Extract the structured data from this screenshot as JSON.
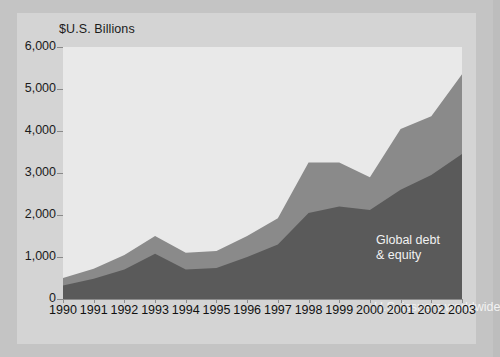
{
  "chart_data": {
    "type": "area",
    "title": "",
    "ylabel": "$U.S. Billions",
    "xlabel": "",
    "ylim": [
      0,
      6000
    ],
    "yticks": [
      0,
      1000,
      2000,
      3000,
      4000,
      5000,
      6000
    ],
    "ytick_labels": [
      "0",
      "1,000",
      "2,000",
      "3,000",
      "4,000",
      "5,000",
      "6,000"
    ],
    "categories": [
      "1990",
      "1991",
      "1992",
      "1993",
      "1994",
      "1995",
      "1996",
      "1997",
      "1998",
      "1999",
      "2000",
      "2001",
      "2002",
      "2003"
    ],
    "stacked": true,
    "grid": false,
    "legend_position": "inline-annotations",
    "series": [
      {
        "name": "U.S. issuers worldwide",
        "color": "#5a5a5a",
        "values": [
          320,
          480,
          700,
          1080,
          700,
          740,
          1000,
          1300,
          2050,
          2200,
          2120,
          2600,
          2950,
          3450
        ]
      },
      {
        "name": "Global debt & equity",
        "color": "#8a8a8a",
        "values": [
          180,
          240,
          350,
          420,
          400,
          400,
          500,
          620,
          1200,
          1050,
          780,
          1450,
          1400,
          1900
        ]
      }
    ],
    "totals": [
      500,
      720,
      1050,
      1500,
      1100,
      1140,
      1500,
      1920,
      3250,
      3250,
      2900,
      4050,
      4350,
      5350
    ],
    "annotations": [
      {
        "name": "global-debt-equity-label",
        "text": "Global debt\n& equity",
        "color": "#f2f2f2"
      },
      {
        "name": "us-issuers-label",
        "text": "U.S. issuers worldwide",
        "color": "#f2f2f2"
      }
    ]
  },
  "annotation_text": {
    "global_line1": "Global debt",
    "global_line2": "& equity",
    "us_issuers": "U.S. issuers worldwide"
  },
  "colors": {
    "page_background": "#c4c4c4",
    "inner_background": "#d4d4d4",
    "plot_background": "#e9e9e9",
    "lower_series": "#5a5a5a",
    "upper_series": "#8a8a8a",
    "axis": "#8c8c8c",
    "text": "#1b1b1b",
    "label_text": "#f2f2f2"
  }
}
